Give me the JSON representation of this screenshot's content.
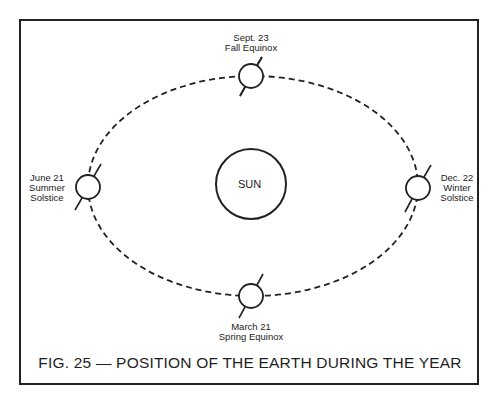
{
  "figure": {
    "caption": "FIG. 25 — POSITION OF THE EARTH DURING THE YEAR",
    "center_body": {
      "label": "SUN"
    },
    "orbit": {
      "style": "dashed",
      "shape": "ellipse"
    },
    "positions": [
      {
        "id": "fall-equinox",
        "line1": "Sept. 23",
        "line2": "Fall Equinox",
        "line3": "",
        "placement": "top"
      },
      {
        "id": "summer-solstice",
        "line1": "June 21",
        "line2": "Summer",
        "line3": "Solstice",
        "placement": "left"
      },
      {
        "id": "winter-solstice",
        "line1": "Dec. 22",
        "line2": "Winter",
        "line3": "Solstice",
        "placement": "right"
      },
      {
        "id": "spring-equinox",
        "line1": "March 21",
        "line2": "Spring Equinox",
        "line3": "",
        "placement": "bottom"
      }
    ]
  },
  "colors": {
    "line": "#222222",
    "background": "#ffffff"
  }
}
